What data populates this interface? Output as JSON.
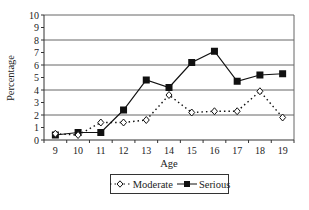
{
  "chart_data": {
    "type": "line",
    "title": "",
    "xlabel": "Age",
    "ylabel": "Percentage",
    "x": [
      9,
      10,
      11,
      12,
      13,
      14,
      15,
      16,
      17,
      18,
      19
    ],
    "categories": [
      "9",
      "10",
      "11",
      "12",
      "13",
      "14",
      "15",
      "16",
      "17",
      "18",
      "19"
    ],
    "ylim": [
      0,
      10
    ],
    "yticks": [
      0,
      1,
      2,
      3,
      4,
      5,
      6,
      7,
      8,
      9,
      10
    ],
    "grid": "horizontal at even values (2,4,6,8,10)",
    "legend_position": "bottom",
    "series": [
      {
        "name": "Moderate",
        "style": "dotted line, open diamond markers",
        "values": [
          0.5,
          0.4,
          1.4,
          1.4,
          1.6,
          3.6,
          2.2,
          2.3,
          2.3,
          3.9,
          1.8
        ]
      },
      {
        "name": "Serious",
        "style": "solid line, filled square markers",
        "values": [
          0.4,
          0.6,
          0.6,
          2.4,
          4.8,
          4.2,
          6.2,
          7.1,
          4.7,
          5.2,
          5.3
        ]
      }
    ]
  },
  "legend": {
    "moderate_label": "Moderate",
    "serious_label": "Serious"
  },
  "colors": {
    "line": "#111111",
    "grid": "#666666",
    "background": "#ffffff"
  }
}
